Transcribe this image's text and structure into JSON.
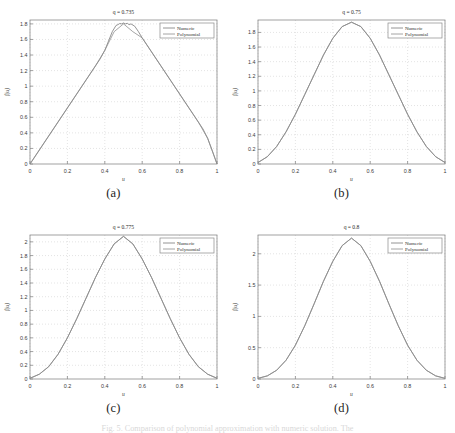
{
  "figure": {
    "caption": "Fig. 5. Comparison of polynomial approximation with numeric solution. The",
    "sublabels": [
      "(a)",
      "(b)",
      "(c)",
      "(d)"
    ]
  },
  "chart_data": [
    {
      "type": "line",
      "title": "q = 0.735",
      "xlabel": "u",
      "ylabel": "f(u)",
      "xlim": [
        0,
        1
      ],
      "ylim": [
        0,
        1.85
      ],
      "xticks": [
        "0",
        "0.2",
        "0.4",
        "0.6",
        "0.8",
        "1"
      ],
      "xtick_values": [
        0,
        0.2,
        0.4,
        0.6,
        0.8,
        1
      ],
      "yticks": [
        "0",
        "0.2",
        "0.4",
        "0.6",
        "0.8",
        "1",
        "1.2",
        "1.4",
        "1.6",
        "1.8"
      ],
      "ytick_values": [
        0,
        0.2,
        0.4,
        0.6,
        0.8,
        1,
        1.2,
        1.4,
        1.6,
        1.8
      ],
      "grid": true,
      "legend": [
        "Numeric",
        "Polynomial"
      ],
      "legend_position": "top-right",
      "series": [
        {
          "name": "Numeric",
          "color": "#7a7a7a",
          "x": [
            0,
            0.025,
            0.05,
            0.075,
            0.1,
            0.125,
            0.15,
            0.175,
            0.2,
            0.225,
            0.25,
            0.275,
            0.3,
            0.325,
            0.35,
            0.375,
            0.4,
            0.42,
            0.44,
            0.46,
            0.47,
            0.48,
            0.49,
            0.5,
            0.51,
            0.52,
            0.53,
            0.54,
            0.56,
            0.58,
            0.6,
            0.625,
            0.65,
            0.675,
            0.7,
            0.725,
            0.75,
            0.775,
            0.8,
            0.825,
            0.85,
            0.875,
            0.9,
            0.925,
            0.95,
            0.975,
            1
          ],
          "y": [
            0,
            0.09,
            0.18,
            0.27,
            0.36,
            0.45,
            0.54,
            0.63,
            0.72,
            0.81,
            0.9,
            0.99,
            1.08,
            1.17,
            1.26,
            1.35,
            1.46,
            1.58,
            1.7,
            1.78,
            1.79,
            1.805,
            1.8,
            1.812,
            1.8,
            1.808,
            1.79,
            1.8,
            1.77,
            1.7,
            1.62,
            1.53,
            1.44,
            1.35,
            1.26,
            1.17,
            1.08,
            0.99,
            0.9,
            0.81,
            0.72,
            0.63,
            0.54,
            0.45,
            0.33,
            0.17,
            0
          ]
        },
        {
          "name": "Polynomial",
          "color": "#8e8e8e",
          "x": [
            0,
            0.05,
            0.1,
            0.15,
            0.2,
            0.25,
            0.3,
            0.35,
            0.4,
            0.45,
            0.5,
            0.55,
            0.6,
            0.65,
            0.7,
            0.75,
            0.8,
            0.85,
            0.9,
            0.95,
            1
          ],
          "y": [
            0,
            0.18,
            0.36,
            0.54,
            0.72,
            0.9,
            1.08,
            1.26,
            1.46,
            1.7,
            1.8,
            1.7,
            1.62,
            1.44,
            1.26,
            1.08,
            0.9,
            0.72,
            0.54,
            0.33,
            0
          ]
        }
      ]
    },
    {
      "type": "line",
      "title": "q = 0.75",
      "xlabel": "u",
      "ylabel": "f(u)",
      "xlim": [
        0,
        1
      ],
      "ylim": [
        0,
        1.97
      ],
      "xticks": [
        "0",
        "0.2",
        "0.4",
        "0.6",
        "0.8",
        "1"
      ],
      "xtick_values": [
        0,
        0.2,
        0.4,
        0.6,
        0.8,
        1
      ],
      "yticks": [
        "0",
        "0.2",
        "0.4",
        "0.6",
        "0.8",
        "1",
        "1.2",
        "1.4",
        "1.6",
        "1.8"
      ],
      "ytick_values": [
        0,
        0.2,
        0.4,
        0.6,
        0.8,
        1,
        1.2,
        1.4,
        1.6,
        1.8
      ],
      "grid": true,
      "legend": [
        "Numeric",
        "Polynomial"
      ],
      "legend_position": "top-right",
      "series": [
        {
          "name": "Numeric",
          "color": "#7a7a7a",
          "x": [
            0,
            0.05,
            0.1,
            0.15,
            0.2,
            0.25,
            0.3,
            0.35,
            0.4,
            0.45,
            0.5,
            0.55,
            0.6,
            0.65,
            0.7,
            0.75,
            0.8,
            0.85,
            0.9,
            0.95,
            1
          ],
          "y": [
            0.02,
            0.1,
            0.24,
            0.44,
            0.68,
            0.95,
            1.22,
            1.49,
            1.72,
            1.88,
            1.94,
            1.88,
            1.72,
            1.49,
            1.22,
            0.95,
            0.68,
            0.44,
            0.24,
            0.1,
            0.02
          ]
        },
        {
          "name": "Polynomial",
          "color": "#8e8e8e",
          "x": [
            0,
            0.05,
            0.1,
            0.15,
            0.2,
            0.25,
            0.3,
            0.35,
            0.4,
            0.45,
            0.5,
            0.55,
            0.6,
            0.65,
            0.7,
            0.75,
            0.8,
            0.85,
            0.9,
            0.95,
            1
          ],
          "y": [
            0.02,
            0.1,
            0.24,
            0.44,
            0.68,
            0.95,
            1.22,
            1.49,
            1.72,
            1.88,
            1.94,
            1.88,
            1.72,
            1.49,
            1.22,
            0.95,
            0.68,
            0.44,
            0.24,
            0.1,
            0.02
          ]
        }
      ]
    },
    {
      "type": "line",
      "title": "q = 0.775",
      "xlabel": "u",
      "ylabel": "f(u)",
      "xlim": [
        0,
        1
      ],
      "ylim": [
        0,
        2.1
      ],
      "xticks": [
        "0",
        "0.2",
        "0.4",
        "0.6",
        "0.8",
        "1"
      ],
      "xtick_values": [
        0,
        0.2,
        0.4,
        0.6,
        0.8,
        1
      ],
      "yticks": [
        "0",
        "0.2",
        "0.4",
        "0.6",
        "0.8",
        "1",
        "1.2",
        "1.4",
        "1.6",
        "1.8",
        "2"
      ],
      "ytick_values": [
        0,
        0.2,
        0.4,
        0.6,
        0.8,
        1,
        1.2,
        1.4,
        1.6,
        1.8,
        2
      ],
      "grid": true,
      "legend": [
        "Numeric",
        "Polynomial"
      ],
      "legend_position": "top-right",
      "series": [
        {
          "name": "Numeric",
          "color": "#7a7a7a",
          "x": [
            0,
            0.05,
            0.1,
            0.15,
            0.2,
            0.25,
            0.3,
            0.35,
            0.4,
            0.45,
            0.5,
            0.55,
            0.6,
            0.65,
            0.7,
            0.75,
            0.8,
            0.85,
            0.9,
            0.95,
            1
          ],
          "y": [
            0.01,
            0.07,
            0.18,
            0.36,
            0.6,
            0.88,
            1.18,
            1.48,
            1.75,
            1.97,
            2.08,
            1.97,
            1.75,
            1.48,
            1.18,
            0.88,
            0.6,
            0.36,
            0.18,
            0.07,
            0.01
          ]
        },
        {
          "name": "Polynomial",
          "color": "#8e8e8e",
          "x": [
            0,
            0.05,
            0.1,
            0.15,
            0.2,
            0.25,
            0.3,
            0.35,
            0.4,
            0.45,
            0.5,
            0.55,
            0.6,
            0.65,
            0.7,
            0.75,
            0.8,
            0.85,
            0.9,
            0.95,
            1
          ],
          "y": [
            0.01,
            0.07,
            0.18,
            0.36,
            0.6,
            0.88,
            1.18,
            1.48,
            1.75,
            1.97,
            2.08,
            1.97,
            1.75,
            1.48,
            1.18,
            0.88,
            0.6,
            0.36,
            0.18,
            0.07,
            0.01
          ]
        }
      ]
    },
    {
      "type": "line",
      "title": "q = 0.8",
      "xlabel": "u",
      "ylabel": "f(u)",
      "xlim": [
        0,
        1
      ],
      "ylim": [
        0,
        2.3
      ],
      "xticks": [
        "0",
        "0.2",
        "0.4",
        "0.6",
        "0.8",
        "1"
      ],
      "xtick_values": [
        0,
        0.2,
        0.4,
        0.6,
        0.8,
        1
      ],
      "yticks": [
        "0",
        "0.5",
        "1",
        "1.5",
        "2"
      ],
      "ytick_values": [
        0,
        0.5,
        1,
        1.5,
        2
      ],
      "grid": true,
      "legend": [
        "Numeric",
        "Polynomial"
      ],
      "legend_position": "top-right",
      "series": [
        {
          "name": "Numeric",
          "color": "#7a7a7a",
          "x": [
            0,
            0.05,
            0.1,
            0.15,
            0.2,
            0.25,
            0.3,
            0.35,
            0.4,
            0.45,
            0.5,
            0.55,
            0.6,
            0.65,
            0.7,
            0.75,
            0.8,
            0.85,
            0.9,
            0.95,
            1
          ],
          "y": [
            0.01,
            0.05,
            0.14,
            0.3,
            0.54,
            0.85,
            1.2,
            1.56,
            1.88,
            2.13,
            2.25,
            2.13,
            1.88,
            1.56,
            1.2,
            0.85,
            0.54,
            0.3,
            0.14,
            0.05,
            0.01
          ]
        },
        {
          "name": "Polynomial",
          "color": "#8e8e8e",
          "x": [
            0,
            0.05,
            0.1,
            0.15,
            0.2,
            0.25,
            0.3,
            0.35,
            0.4,
            0.45,
            0.5,
            0.55,
            0.6,
            0.65,
            0.7,
            0.75,
            0.8,
            0.85,
            0.9,
            0.95,
            1
          ],
          "y": [
            0.01,
            0.05,
            0.14,
            0.3,
            0.54,
            0.85,
            1.2,
            1.56,
            1.88,
            2.13,
            2.25,
            2.13,
            1.88,
            1.56,
            1.2,
            0.85,
            0.54,
            0.3,
            0.14,
            0.05,
            0.01
          ]
        }
      ]
    }
  ]
}
